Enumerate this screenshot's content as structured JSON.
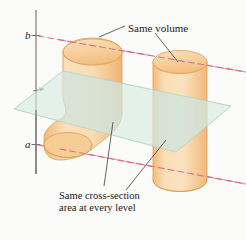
{
  "figure": {
    "background_color": "#fbfbf9",
    "axis": {
      "name": "vertical-axis",
      "color": "#6b6b6b",
      "top_y": 10,
      "bottom_y": 174,
      "x": 36
    },
    "axis_labels": {
      "upper": "b",
      "lower": "a"
    },
    "level_lines": {
      "color": "#d9708f",
      "style": "dashed",
      "upper_label": "b",
      "lower_label": "a"
    },
    "plane": {
      "name": "cutting-plane",
      "fill_color": "#d5e8e0",
      "stroke_color": "#a9ccc0",
      "opacity": 0.72
    },
    "solids": [
      {
        "name": "left-solid",
        "shape": "bent-oblique-cylinder",
        "fill_color": "#f6c98f",
        "stroke_color": "#e09a4e"
      },
      {
        "name": "right-solid",
        "shape": "right-circular-cylinder",
        "fill_color": "#f6c98f",
        "stroke_color": "#e09a4e"
      }
    ],
    "annotations": {
      "same_volume": "Same volume",
      "cross_section_line1": "Same cross-section",
      "cross_section_line2": "area at every level"
    },
    "leader_line_color": "#4a4a4a"
  }
}
